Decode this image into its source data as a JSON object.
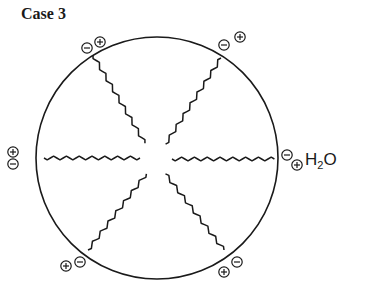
{
  "title": "Case 3",
  "molecule_label": {
    "main": "H",
    "sub": "2",
    "tail": "O"
  },
  "circle": {
    "cx": 157,
    "cy": 158,
    "r": 121,
    "stroke": "#1a1a1a"
  },
  "chains": [
    {
      "name": "upper-left",
      "x1": 93,
      "y1": 55,
      "x2": 146,
      "y2": 145
    },
    {
      "name": "upper-right",
      "x1": 221,
      "y1": 58,
      "x2": 165,
      "y2": 145
    },
    {
      "name": "left",
      "x1": 44,
      "y1": 158,
      "x2": 140,
      "y2": 158
    },
    {
      "name": "right",
      "x1": 172,
      "y1": 159,
      "x2": 275,
      "y2": 159
    },
    {
      "name": "lower-left",
      "x1": 88,
      "y1": 250,
      "x2": 147,
      "y2": 173
    },
    {
      "name": "lower-right",
      "x1": 224,
      "y1": 250,
      "x2": 164,
      "y2": 172
    }
  ],
  "charges": [
    {
      "sign": "-",
      "x": 87,
      "y": 48
    },
    {
      "sign": "+",
      "x": 100,
      "y": 42
    },
    {
      "sign": "-",
      "x": 224,
      "y": 45
    },
    {
      "sign": "+",
      "x": 240,
      "y": 37
    },
    {
      "sign": "+",
      "x": 13,
      "y": 152
    },
    {
      "sign": "-",
      "x": 13,
      "y": 164
    },
    {
      "sign": "-",
      "x": 287,
      "y": 155
    },
    {
      "sign": "+",
      "x": 297,
      "y": 165
    },
    {
      "sign": "+",
      "x": 66,
      "y": 266
    },
    {
      "sign": "-",
      "x": 80,
      "y": 262
    },
    {
      "sign": "+",
      "x": 224,
      "y": 272
    },
    {
      "sign": "-",
      "x": 237,
      "y": 262
    }
  ]
}
